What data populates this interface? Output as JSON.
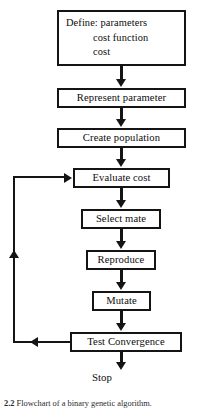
{
  "figure": {
    "type": "flowchart",
    "caption_number": "2.2",
    "caption_text": "Flowchart of a binary genetic algorithm.",
    "background_color": "#ffffff",
    "line_color": "#141414",
    "text_color": "#0d0d0d"
  },
  "nodes": {
    "define": {
      "id": "define",
      "shape": "rectangle",
      "label": "Define: parameters\n          cost function\n          cost",
      "lines": [
        "Define: parameters",
        "cost function",
        "cost"
      ]
    },
    "represent": {
      "id": "represent",
      "shape": "rectangle",
      "label": "Represent parameter"
    },
    "create": {
      "id": "create",
      "shape": "rectangle",
      "label": "Create population"
    },
    "evaluate": {
      "id": "evaluate",
      "shape": "rectangle",
      "label": "Evaluate cost"
    },
    "select": {
      "id": "select",
      "shape": "rectangle",
      "label": "Select mate"
    },
    "reproduce": {
      "id": "reproduce",
      "shape": "rectangle",
      "label": "Reproduce"
    },
    "mutate": {
      "id": "mutate",
      "shape": "rectangle",
      "label": "Mutate"
    },
    "test": {
      "id": "test",
      "shape": "rectangle",
      "label": "Test Convergence"
    },
    "stop": {
      "id": "stop",
      "shape": "terminal-text",
      "label": "Stop"
    }
  },
  "edges": [
    {
      "from": "define",
      "to": "represent",
      "direction": "down"
    },
    {
      "from": "represent",
      "to": "create",
      "direction": "down"
    },
    {
      "from": "create",
      "to": "evaluate",
      "direction": "down"
    },
    {
      "from": "evaluate",
      "to": "select",
      "direction": "down"
    },
    {
      "from": "select",
      "to": "reproduce",
      "direction": "down"
    },
    {
      "from": "reproduce",
      "to": "mutate",
      "direction": "down"
    },
    {
      "from": "mutate",
      "to": "test",
      "direction": "down"
    },
    {
      "from": "test",
      "to": "stop",
      "direction": "down"
    },
    {
      "from": "test",
      "to": "evaluate",
      "direction": "feedback-loop-left"
    }
  ]
}
